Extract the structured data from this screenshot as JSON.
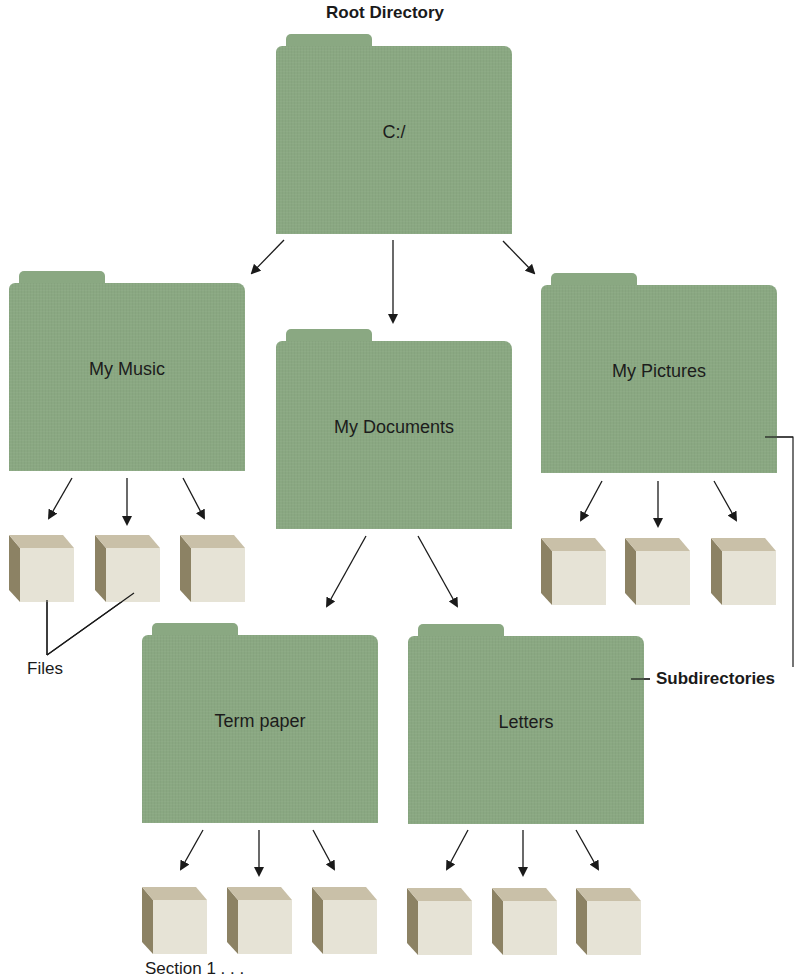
{
  "title": "Root Directory",
  "colors": {
    "folder": "#8aa882",
    "cube_front": "#e6e3d6",
    "cube_top": "#c9c0a8",
    "cube_side": "#8c8264",
    "line": "#1a1a1a"
  },
  "folders": {
    "root": {
      "label": "C:/"
    },
    "music": {
      "label": "My Music"
    },
    "documents": {
      "label": "My Documents"
    },
    "pictures": {
      "label": "My Pictures"
    },
    "term_paper": {
      "label": "Term paper"
    },
    "letters": {
      "label": "Letters"
    }
  },
  "annotations": {
    "files": "Files",
    "subdirectories": "Subdirectories",
    "section": "Section 1 . . ."
  },
  "icons": {
    "folder": "folder-icon",
    "file": "file-cube-icon",
    "arrow": "arrow-down-icon"
  }
}
